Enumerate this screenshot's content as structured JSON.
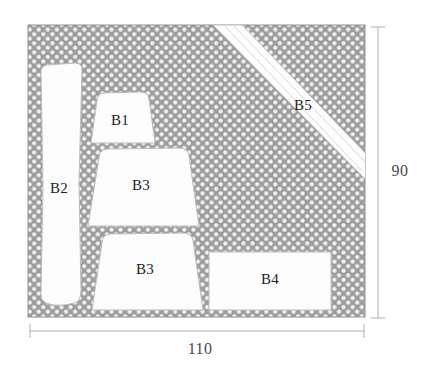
{
  "figure": {
    "stock": {
      "name": "stock-sheet",
      "fill_color": "#9d9d9d",
      "dot_color": "#f2f2f2",
      "width_value": "110",
      "height_value": "90"
    },
    "dimensions": [
      {
        "id": "width-dimension",
        "label": "110",
        "orientation": "horizontal",
        "position": "bottom"
      },
      {
        "id": "height-dimension",
        "label": "90",
        "orientation": "vertical",
        "position": "right"
      }
    ],
    "parts": [
      {
        "id": "part-b1",
        "label": "B1",
        "shape": "trapezoid",
        "label_x": 120,
        "label_y": 122
      },
      {
        "id": "part-b2",
        "label": "B2",
        "shape": "tall-waisted-strip",
        "label_x": 59,
        "label_y": 190
      },
      {
        "id": "part-b3-upper",
        "label": "B3",
        "shape": "trapezoid",
        "label_x": 141,
        "label_y": 187
      },
      {
        "id": "part-b3-lower",
        "label": "B3",
        "shape": "trapezoid",
        "label_x": 145,
        "label_y": 271
      },
      {
        "id": "part-b4",
        "label": "B4",
        "shape": "rectangle",
        "label_x": 270,
        "label_y": 281
      },
      {
        "id": "part-b5",
        "label": "B5",
        "shape": "diagonal-strip",
        "label_x": 303,
        "label_y": 107
      }
    ],
    "part_fill_color": "#fdfdfd",
    "part_stroke_color": "#b9b9b9"
  }
}
